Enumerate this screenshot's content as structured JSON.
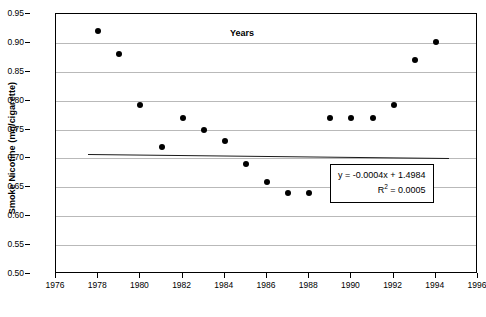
{
  "chart_data": {
    "type": "scatter",
    "title": "",
    "xlabel": "Years",
    "ylabel": "Smoke Nicotine (mg/cigarette)",
    "xlim": [
      1976,
      1996
    ],
    "ylim": [
      0.5,
      0.95
    ],
    "grid": true,
    "legend": "none",
    "x_ticks": [
      1976,
      1978,
      1980,
      1982,
      1984,
      1986,
      1988,
      1990,
      1992,
      1994,
      1996
    ],
    "y_ticks": [
      0.5,
      0.55,
      0.6,
      0.65,
      0.7,
      0.75,
      0.8,
      0.85,
      0.9,
      0.95
    ],
    "x_tick_labels": [
      "1976",
      "1978",
      "1980",
      "1982",
      "1984",
      "1986",
      "1988",
      "1990",
      "1992",
      "1994",
      "1996"
    ],
    "y_tick_labels": [
      "0.50",
      "0.55",
      "0.60",
      "0.65",
      "0.70",
      "0.75",
      "0.80",
      "0.85",
      "0.90",
      "0.95"
    ],
    "series": [
      {
        "name": "Smoke Nicotine",
        "x": [
          1978,
          1979,
          1980,
          1981,
          1982,
          1983,
          1984,
          1985,
          1986,
          1987,
          1988,
          1989,
          1990,
          1991,
          1992,
          1993,
          1994
        ],
        "y": [
          0.92,
          0.88,
          0.792,
          0.72,
          0.77,
          0.75,
          0.73,
          0.69,
          0.66,
          0.64,
          0.64,
          0.77,
          0.77,
          0.77,
          0.792,
          0.87,
          0.902
        ]
      }
    ],
    "trendline": {
      "equation": "y = -0.0004x + 1.4984",
      "r_squared_label": "R",
      "r_squared_exponent": "2",
      "r_squared_value": "= 0.0005",
      "slope": -0.0004,
      "intercept": 1.4984,
      "r2": 0.0005,
      "x_start": 1977.5,
      "x_end": 1994.6
    },
    "annotations": [
      {
        "name": "regression-equation-box",
        "lines": [
          "y = -0.0004x + 1.4984",
          "R2 = 0.0005"
        ]
      }
    ]
  }
}
